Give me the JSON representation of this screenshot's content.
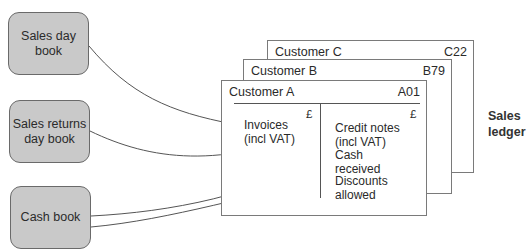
{
  "books": [
    {
      "label": "Sales day book"
    },
    {
      "label": "Sales returns day book"
    },
    {
      "label": "Cash book"
    }
  ],
  "accounts": [
    {
      "name": "Customer C",
      "code": "C22"
    },
    {
      "name": "Customer B",
      "code": "B79"
    },
    {
      "name": "Customer A",
      "code": "A01"
    }
  ],
  "debit_side": {
    "currency": "£",
    "entries": [
      "Invoices (incl VAT)"
    ]
  },
  "credit_side": {
    "currency": "£",
    "entries": [
      "Credit notes (incl VAT)",
      "Cash received",
      "Discounts allowed"
    ]
  },
  "ledger_label": "Sales ledger",
  "colors": {
    "book_fill": "#c9c9c9",
    "line": "#555555"
  }
}
